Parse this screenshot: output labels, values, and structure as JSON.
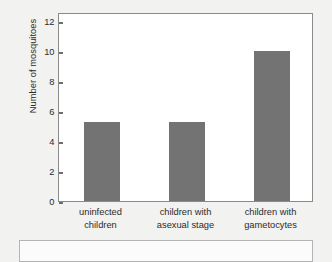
{
  "chart_data": {
    "type": "bar",
    "title": "",
    "xlabel": "",
    "ylabel": "Number of mosquitoes",
    "categories": [
      "uninfected children",
      "children with asexual stage",
      "children with gametocytes"
    ],
    "category_lines": [
      [
        "uninfected",
        "children"
      ],
      [
        "children with",
        "asexual stage"
      ],
      [
        "children with",
        "gametocytes"
      ]
    ],
    "values": [
      5.3,
      5.3,
      10.0
    ],
    "ylim": [
      0,
      12.6
    ],
    "yticks": [
      0,
      2,
      4,
      6,
      8,
      10,
      12
    ],
    "ytick_labels": [
      "0",
      "2",
      "4",
      "6",
      "8",
      "10",
      "12"
    ],
    "grid": false,
    "legend": null,
    "bar_color": "#737373",
    "plot_background": "#ffffff",
    "axis_color": "#8a8a8a",
    "page_background": "#f2f2f1"
  },
  "caption": {
    "text": ""
  }
}
